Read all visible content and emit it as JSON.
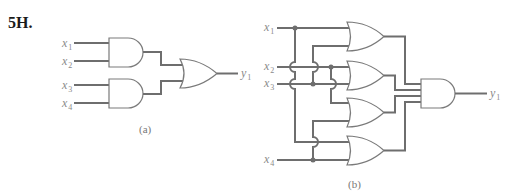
{
  "problem": {
    "label": "5H."
  },
  "circuit_a": {
    "caption": "(a)",
    "inputs": [
      {
        "name": "x",
        "sub": "1"
      },
      {
        "name": "x",
        "sub": "2"
      },
      {
        "name": "x",
        "sub": "3"
      },
      {
        "name": "x",
        "sub": "4"
      }
    ],
    "output": {
      "name": "y",
      "sub": "1"
    },
    "gates": [
      "AND",
      "AND",
      "OR"
    ],
    "expression": "y1 = x1·x2 + x3·x4"
  },
  "circuit_b": {
    "caption": "(b)",
    "inputs": [
      {
        "name": "x",
        "sub": "1"
      },
      {
        "name": "x",
        "sub": "2"
      },
      {
        "name": "x",
        "sub": "3"
      },
      {
        "name": "x",
        "sub": "4"
      }
    ],
    "output": {
      "name": "y",
      "sub": "1"
    },
    "gates": [
      "OR",
      "OR",
      "OR",
      "OR",
      "AND"
    ],
    "expression": "y1 = (x1+x3)(x2+x3)(x2+x4)(x1+x4)"
  }
}
